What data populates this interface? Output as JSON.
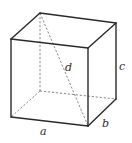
{
  "diagram": {
    "type": "rectangular-box",
    "colors": {
      "edge": "#2a2a2a",
      "hidden_edge": "#6a6a6a",
      "background": "#ffffff"
    },
    "vertices": {
      "front_top_left": [
        11,
        39
      ],
      "front_top_right": [
        88,
        48
      ],
      "front_bottom_left": [
        11,
        117
      ],
      "front_bottom_right": [
        88,
        126
      ],
      "back_top_left": [
        40,
        13
      ],
      "back_top_right": [
        116,
        23
      ],
      "back_bottom_right": [
        116,
        99
      ],
      "back_bottom_left": [
        40,
        91
      ]
    },
    "labels": {
      "a": "a",
      "b": "b",
      "c": "c",
      "d": "d"
    }
  }
}
